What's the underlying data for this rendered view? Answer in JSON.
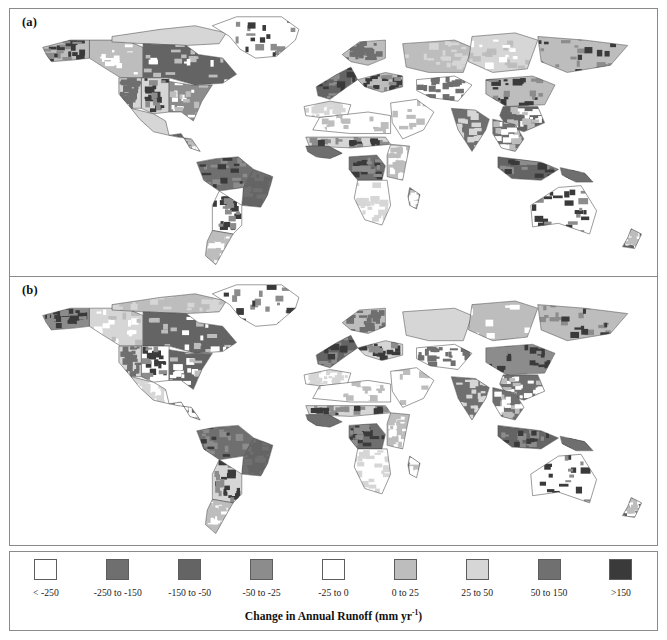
{
  "figure": {
    "panels": [
      {
        "label": "(a)",
        "name": "panel-a"
      },
      {
        "label": "(b)",
        "name": "panel-b"
      }
    ]
  },
  "legend": {
    "caption_text": "Change in Annual Runoff (mm yr",
    "caption_sup": "-1",
    "caption_tail": ")",
    "caption_full": "Change in Annual Runoff (mm yr-1)",
    "items": [
      {
        "label": "< -250",
        "color": "#ffffff"
      },
      {
        "label": "-250 to -150",
        "color": "#6f6f6f"
      },
      {
        "label": "-150 to -50",
        "color": "#646464"
      },
      {
        "label": "-50 to -25",
        "color": "#8c8c8c"
      },
      {
        "label": "-25 to 0",
        "color": "#ffffff"
      },
      {
        "label": "0 to 25",
        "color": "#bdbdbd"
      },
      {
        "label": "25 to 50",
        "color": "#d6d6d6"
      },
      {
        "label": "50 to 150",
        "color": "#707070"
      },
      {
        "label": ">150",
        "color": "#3a3a3a"
      }
    ]
  },
  "chart_data": {
    "type": "heatmap",
    "title": "Change in Annual Runoff (mm yr-1)",
    "subtitle": "",
    "xlabel": "",
    "ylabel": "",
    "grid": false,
    "legend_position": "bottom",
    "projection": "equirectangular",
    "panels": [
      {
        "id": "a",
        "label": "(a)",
        "regions": [
          {
            "name": "Alaska",
            "class": "0 to 25"
          },
          {
            "name": "Western Canada",
            "class": "0 to 25"
          },
          {
            "name": "Canadian Arctic",
            "class": "25 to 50"
          },
          {
            "name": "Eastern Canada",
            "class": "-150 to -50"
          },
          {
            "name": "Greenland",
            "class": "< -250"
          },
          {
            "name": "Western US",
            "class": "25 to 50"
          },
          {
            "name": "Central US",
            "class": "25 to 50"
          },
          {
            "name": "Eastern US",
            "class": "-50 to -25"
          },
          {
            "name": "Mexico",
            "class": "25 to 50"
          },
          {
            "name": "Central America",
            "class": "-150 to -50"
          },
          {
            "name": "Amazon Basin",
            "class": "-250 to -150"
          },
          {
            "name": "Eastern Brazil",
            "class": "-150 to -50"
          },
          {
            "name": "Southern Cone",
            "class": "-25 to 0"
          },
          {
            "name": "Patagonia",
            "class": "0 to 25"
          },
          {
            "name": "Northwest Africa",
            "class": "-25 to 0"
          },
          {
            "name": "Sahara",
            "class": "-25 to 0"
          },
          {
            "name": "Sahel",
            "class": "25 to 50"
          },
          {
            "name": "West Africa",
            "class": "-250 to -150"
          },
          {
            "name": "Congo Basin",
            "class": "-250 to -150"
          },
          {
            "name": "East Africa",
            "class": "0 to 25"
          },
          {
            "name": "Southern Africa",
            "class": "-25 to 0"
          },
          {
            "name": "Madagascar",
            "class": "-150 to -50"
          },
          {
            "name": "Western Europe",
            "class": "-150 to -50"
          },
          {
            "name": "Scandinavia",
            "class": "0 to 25"
          },
          {
            "name": "Eastern Europe",
            "class": "0 to 25"
          },
          {
            "name": "Middle East",
            "class": "-25 to 0"
          },
          {
            "name": "Western Siberia",
            "class": "0 to 25"
          },
          {
            "name": "Central Siberia",
            "class": "25 to 50"
          },
          {
            "name": "Eastern Siberia",
            "class": "0 to 25"
          },
          {
            "name": "Central Asia",
            "class": "-25 to 0"
          },
          {
            "name": "Northern China",
            "class": "0 to 25"
          },
          {
            "name": "Southern China",
            "class": "-150 to -50"
          },
          {
            "name": "India",
            "class": "-250 to -150"
          },
          {
            "name": "Southeast Asia",
            "class": "-250 to -150"
          },
          {
            "name": "Indonesia",
            "class": "-150 to -50"
          },
          {
            "name": "New Guinea",
            "class": "-250 to -150"
          },
          {
            "name": "Australia",
            "class": "-25 to 0"
          },
          {
            "name": "New Zealand",
            "class": "-150 to -50"
          }
        ]
      },
      {
        "id": "b",
        "label": "(b)",
        "regions": [
          {
            "name": "Alaska",
            "class": "-50 to -25"
          },
          {
            "name": "Western Canada",
            "class": "25 to 50"
          },
          {
            "name": "Canadian Arctic",
            "class": "0 to 25"
          },
          {
            "name": "Eastern Canada",
            "class": "-150 to -50"
          },
          {
            "name": "Greenland",
            "class": "< -250"
          },
          {
            "name": "Western US",
            "class": "25 to 50"
          },
          {
            "name": "Central US",
            "class": "-25 to 0"
          },
          {
            "name": "Eastern US",
            "class": "-150 to -50"
          },
          {
            "name": "Mexico",
            "class": "-25 to 0"
          },
          {
            "name": "Central America",
            "class": "-150 to -50"
          },
          {
            "name": "Amazon Basin",
            "class": "-250 to -150"
          },
          {
            "name": "Eastern Brazil",
            "class": "-150 to -50"
          },
          {
            "name": "Southern Cone",
            "class": "25 to 50"
          },
          {
            "name": "Patagonia",
            "class": "0 to 25"
          },
          {
            "name": "Northwest Africa",
            "class": "-25 to 0"
          },
          {
            "name": "Sahara",
            "class": "-25 to 0"
          },
          {
            "name": "Sahel",
            "class": "25 to 50"
          },
          {
            "name": "West Africa",
            "class": "-250 to -150"
          },
          {
            "name": "Congo Basin",
            "class": "-250 to -150"
          },
          {
            "name": "East Africa",
            "class": "0 to 25"
          },
          {
            "name": "Southern Africa",
            "class": "-25 to 0"
          },
          {
            "name": "Madagascar",
            "class": "-150 to -50"
          },
          {
            "name": "Western Europe",
            "class": "-150 to -50"
          },
          {
            "name": "Scandinavia",
            "class": "0 to 25"
          },
          {
            "name": "Eastern Europe",
            "class": "25 to 50"
          },
          {
            "name": "Middle East",
            "class": "-25 to 0"
          },
          {
            "name": "Western Siberia",
            "class": "25 to 50"
          },
          {
            "name": "Central Siberia",
            "class": "0 to 25"
          },
          {
            "name": "Eastern Siberia",
            "class": "0 to 25"
          },
          {
            "name": "Central Asia",
            "class": "-25 to 0"
          },
          {
            "name": "Northern China",
            "class": "-50 to -25"
          },
          {
            "name": "Southern China",
            "class": "-250 to -150"
          },
          {
            "name": "India",
            "class": "-250 to -150"
          },
          {
            "name": "Southeast Asia",
            "class": "-250 to -150"
          },
          {
            "name": "Indonesia",
            "class": "-150 to -50"
          },
          {
            "name": "New Guinea",
            "class": "-250 to -150"
          },
          {
            "name": "Australia",
            "class": "-25 to 0"
          },
          {
            "name": "New Zealand",
            "class": "-150 to -50"
          }
        ]
      }
    ]
  }
}
